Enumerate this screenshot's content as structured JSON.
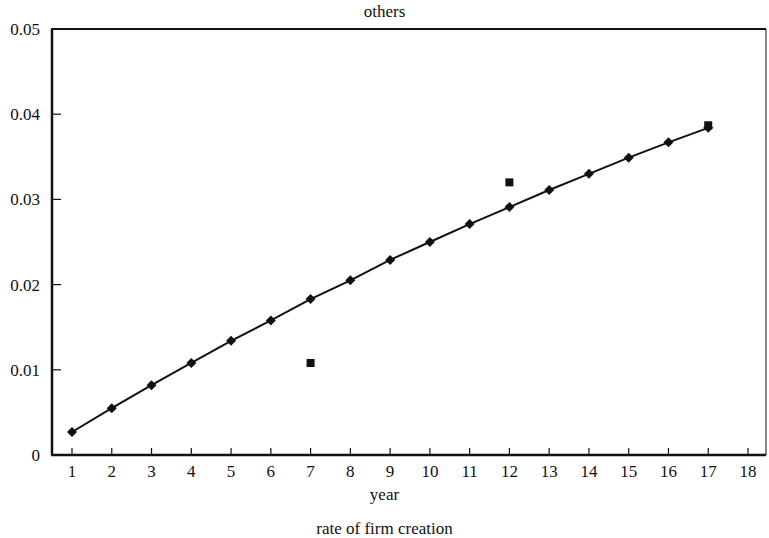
{
  "chart_data": {
    "type": "line",
    "title": "others",
    "xlabel": "year",
    "ylabel": "",
    "caption": "rate of firm creation",
    "x": [
      1,
      2,
      3,
      4,
      5,
      6,
      7,
      8,
      9,
      10,
      11,
      12,
      13,
      14,
      15,
      16,
      17
    ],
    "xlim": [
      0.5,
      18.5
    ],
    "ylim": [
      0,
      0.05
    ],
    "x_ticks": [
      "1",
      "2",
      "3",
      "4",
      "5",
      "6",
      "7",
      "8",
      "9",
      "10",
      "11",
      "12",
      "13",
      "14",
      "15",
      "16",
      "17",
      "18"
    ],
    "y_ticks": [
      "0",
      "0.01",
      "0.02",
      "0.03",
      "0.04",
      "0.05"
    ],
    "grid": false,
    "legend": "none",
    "series": [
      {
        "name": "simulated",
        "marker": "diamond",
        "line": true,
        "x": [
          1,
          2,
          3,
          4,
          5,
          6,
          7,
          8,
          9,
          10,
          11,
          12,
          13,
          14,
          15,
          16,
          17
        ],
        "values": [
          0.0027,
          0.0055,
          0.0082,
          0.0108,
          0.0134,
          0.0158,
          0.0183,
          0.0205,
          0.0229,
          0.025,
          0.0271,
          0.0291,
          0.0311,
          0.033,
          0.0349,
          0.0367,
          0.0384
        ]
      },
      {
        "name": "observed",
        "marker": "square",
        "line": false,
        "x": [
          7,
          12,
          17
        ],
        "values": [
          0.0108,
          0.032,
          0.0387
        ]
      }
    ]
  },
  "colors": {
    "ink": "#111111",
    "background": "#ffffff"
  }
}
